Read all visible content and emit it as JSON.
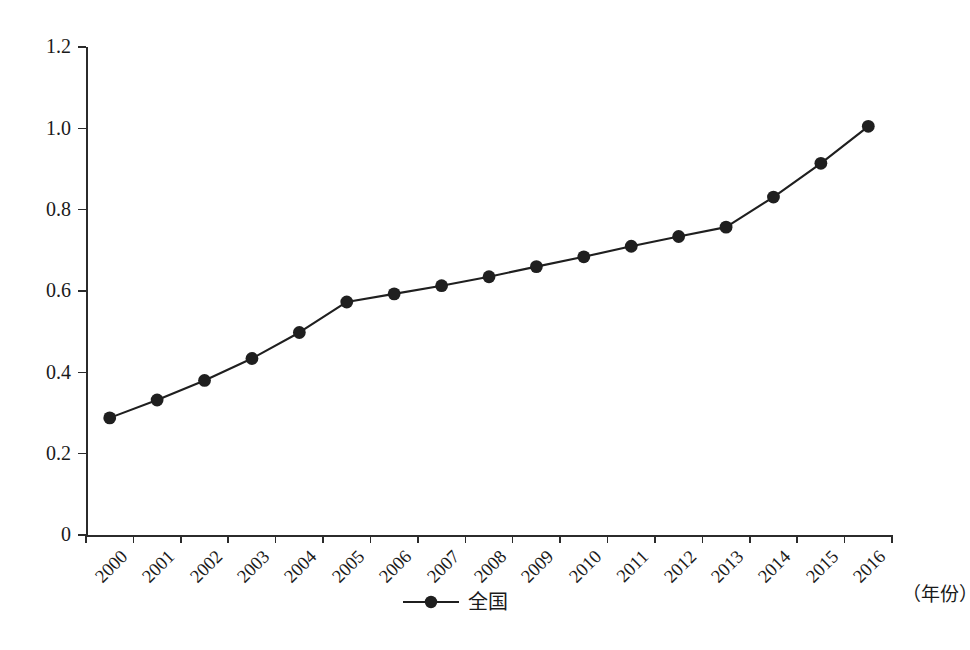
{
  "chart_data": {
    "type": "line",
    "title": "",
    "subtitle": "",
    "xlabel": "（年份）",
    "ylabel": "",
    "grid": false,
    "legend_position": "bottom-center",
    "categories": [
      "2000",
      "2001",
      "2002",
      "2003",
      "2004",
      "2005",
      "2006",
      "2007",
      "2008",
      "2009",
      "2010",
      "2011",
      "2012",
      "2013",
      "2014",
      "2015",
      "2016"
    ],
    "ylim": [
      0,
      1.2
    ],
    "ytick_labels": [
      "0",
      "0.2",
      "0.4",
      "0.6",
      "0.8",
      "1.0",
      "1.2"
    ],
    "ytick_values": [
      0,
      0.2,
      0.4,
      0.6,
      0.8,
      1.0,
      1.2
    ],
    "series": [
      {
        "name": "全国",
        "marker": "filled-circle",
        "color": "#1f1f1f",
        "values": [
          0.288,
          0.332,
          0.38,
          0.434,
          0.498,
          0.573,
          0.593,
          0.613,
          0.635,
          0.66,
          0.684,
          0.71,
          0.734,
          0.757,
          0.831,
          0.914,
          1.005
        ]
      }
    ]
  },
  "legend": {
    "items": [
      {
        "label": "全国",
        "color": "#1f1f1f"
      }
    ]
  },
  "axes": {
    "x_axis_title": "（年份）"
  },
  "colors": {
    "series": "#1f1f1f",
    "axis": "#2b2b2b",
    "text": "#1a1a1a",
    "background": "#ffffff"
  }
}
